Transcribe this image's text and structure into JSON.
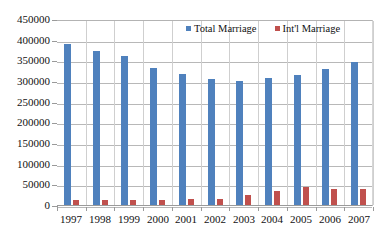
{
  "chart_data": {
    "type": "bar",
    "title": "",
    "xlabel": "",
    "ylabel": "",
    "categories": [
      "1997",
      "1998",
      "1999",
      "2000",
      "2001",
      "2002",
      "2003",
      "2004",
      "2005",
      "2006",
      "2007"
    ],
    "series": [
      {
        "name": "Total Marriage",
        "color": "#4f81bd",
        "values": [
          390000,
          372000,
          360000,
          332000,
          318000,
          305000,
          300000,
          308000,
          315000,
          330000,
          345000
        ]
      },
      {
        "name": "Int'l Marriage",
        "color": "#c0504d",
        "values": [
          13000,
          12000,
          11000,
          12000,
          15000,
          15000,
          25000,
          35000,
          43000,
          39000,
          38000
        ]
      }
    ],
    "ylim": [
      0,
      450000
    ],
    "ytick_step": 50000,
    "yticks": [
      "450000",
      "400000",
      "350000",
      "300000",
      "250000",
      "200000",
      "150000",
      "100000",
      "50000",
      "0"
    ],
    "grid": true,
    "legend_position": "top-inside"
  },
  "legend": {
    "items": [
      {
        "label": "Total Marriage",
        "color": "#4f81bd"
      },
      {
        "label": "Int'l Marriage",
        "color": "#c0504d"
      }
    ]
  }
}
